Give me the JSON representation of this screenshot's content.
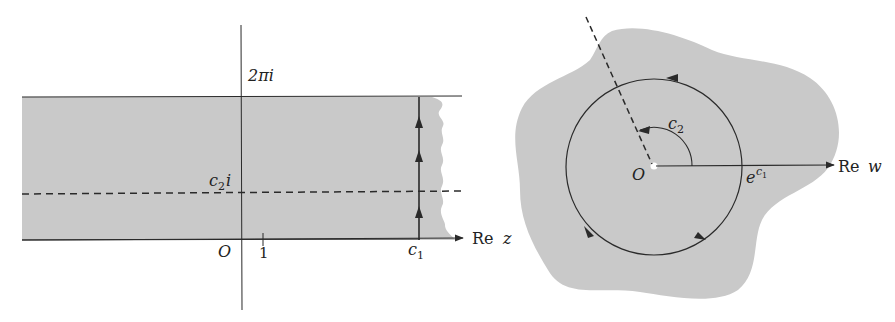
{
  "colors": {
    "fill": "#c9c9c9",
    "line": "#2a2a2a",
    "background": "#ffffff"
  },
  "left_panel": {
    "description": "strip in the z-plane",
    "labels": {
      "top_imag": "2πi",
      "mid_imag_c": "c",
      "mid_imag_sub": "2",
      "mid_imag_i": "i",
      "origin": "O",
      "tick_one": "1",
      "c1_c": "c",
      "c1_sub": "1",
      "axis_re": "Re",
      "axis_var": "z"
    }
  },
  "right_panel": {
    "description": "annulus region in the w-plane",
    "labels": {
      "angle_c": "c",
      "angle_sub": "2",
      "origin": "O",
      "radius_e": "e",
      "radius_c": "c",
      "radius_sub": "1",
      "axis_re": "Re",
      "axis_var": "w"
    }
  }
}
